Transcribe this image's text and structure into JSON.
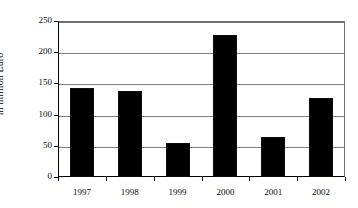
{
  "chart_data": {
    "type": "bar",
    "title": "",
    "subtitle": "",
    "xlabel": "",
    "ylabel": "in million Euro",
    "categories": [
      "1997",
      "1998",
      "1999",
      "2000",
      "2001",
      "2002"
    ],
    "values": [
      142,
      138,
      54,
      227,
      64,
      127
    ],
    "series": [
      {
        "name": "in million Euro",
        "values": [
          142,
          138,
          54,
          227,
          64,
          127
        ]
      }
    ],
    "ylim": [
      0,
      250
    ],
    "ytick_labels": [
      "0",
      "50",
      "100",
      "150",
      "200",
      "250"
    ],
    "ytick_values": [
      0,
      50,
      100,
      150,
      200,
      250
    ],
    "grid": "horizontal",
    "legend": "none",
    "bar_color": "#000000",
    "gridline_color": "#7f7f7f",
    "axis_color": "#000000",
    "background_color": "#ffffff"
  },
  "axes": {
    "y_title": "in million Euro"
  }
}
